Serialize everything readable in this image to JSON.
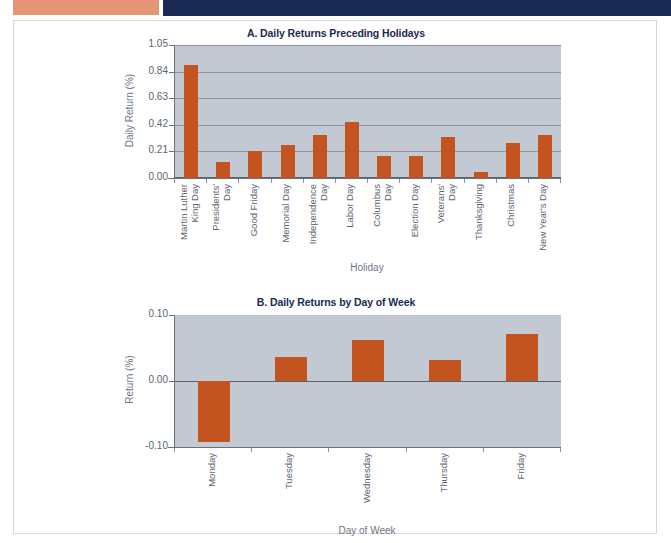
{
  "figure": {
    "bands": {
      "orange_color": "#e49674",
      "navy_color": "#1b2a52"
    },
    "colors": {
      "bar": "#c4541f",
      "plot_background": "#c3c9d2",
      "title": "#1b2a52",
      "gridline": "#8d93a0",
      "axis_text": "#5e636e"
    }
  },
  "chart_data": [
    {
      "type": "bar",
      "panel": "A",
      "title": "A. Daily Returns Preceding Holidays",
      "xlabel": "Holiday",
      "ylabel": "Daily Return (%)",
      "ylim": [
        0.0,
        1.05
      ],
      "yticks": [
        "0.00",
        "0.21",
        "0.42",
        "0.63",
        "0.84",
        "1.05"
      ],
      "ytick_values": [
        0.0,
        0.21,
        0.42,
        0.63,
        0.84,
        1.05
      ],
      "grid": true,
      "legend": "none",
      "categories": [
        "Martin Luther King Day",
        "Presidents' Day",
        "Good Friday",
        "Memorial Day",
        "Independence Day",
        "Labor Day",
        "Columbus Day",
        "Election Day",
        "Veterans' Day",
        "Thanksgiving",
        "Christmas",
        "New Year's Day"
      ],
      "category_lines": [
        [
          "Martin Luther",
          "King Day"
        ],
        [
          "Presidents'",
          "Day"
        ],
        [
          "Good Friday"
        ],
        [
          "Memorial Day"
        ],
        [
          "Independence",
          "Day"
        ],
        [
          "Labor Day"
        ],
        [
          "Columbus",
          "Day"
        ],
        [
          "Election Day"
        ],
        [
          "Veterans'",
          "Day"
        ],
        [
          "Thanksgiving"
        ],
        [
          "Christmas"
        ],
        [
          "New Year's Day"
        ]
      ],
      "values": [
        0.89,
        0.13,
        0.21,
        0.26,
        0.34,
        0.44,
        0.17,
        0.17,
        0.32,
        0.05,
        0.28,
        0.34
      ]
    },
    {
      "type": "bar",
      "panel": "B",
      "title": "B. Daily Returns by Day of Week",
      "xlabel": "Day of Week",
      "ylabel": "Return (%)",
      "ylim": [
        -0.1,
        0.1
      ],
      "yticks": [
        "0.10",
        "0.00",
        "-0.10"
      ],
      "ytick_values": [
        0.1,
        0.0,
        -0.1
      ],
      "grid": false,
      "legend": "none",
      "categories": [
        "Monday",
        "Tuesday",
        "Wednesday",
        "Thursday",
        "Friday"
      ],
      "category_lines": [
        [
          "Monday"
        ],
        [
          "Tuesday"
        ],
        [
          "Wednesday"
        ],
        [
          "Thursday"
        ],
        [
          "Friday"
        ]
      ],
      "values": [
        -0.093,
        0.036,
        0.062,
        0.032,
        0.071
      ]
    }
  ]
}
